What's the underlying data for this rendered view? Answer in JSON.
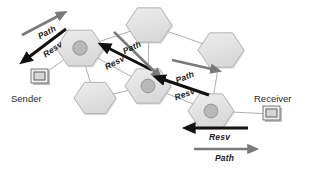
{
  "diagram": {
    "colors": {
      "path_arrow": "#7a7a7a",
      "resv_arrow": "#111111",
      "hex_fill": "#e2e2e2",
      "hex_stroke": "#a9a9a9",
      "router_circle": "#b8b8b8",
      "link_stroke": "#9a9a9a",
      "background": "#ffffff",
      "text": "#1c1c1c"
    },
    "endpoints": [
      {
        "id": "sender",
        "label": "Sender",
        "icon": "computer-icon",
        "x": 40,
        "y": 77,
        "label_x": 11,
        "label_y": 93
      },
      {
        "id": "receiver",
        "label": "Receiver",
        "icon": "computer-icon",
        "x": 272,
        "y": 114,
        "label_x": 254,
        "label_y": 93
      }
    ],
    "nodes": [
      {
        "id": "r1",
        "type": "router",
        "x": 80,
        "y": 48,
        "r": 24
      },
      {
        "id": "n2",
        "type": "plain",
        "x": 149,
        "y": 25,
        "r": 23
      },
      {
        "id": "n3",
        "type": "plain",
        "x": 221,
        "y": 50,
        "r": 23
      },
      {
        "id": "r4",
        "type": "router",
        "x": 148,
        "y": 86,
        "r": 23
      },
      {
        "id": "n5",
        "type": "plain",
        "x": 95,
        "y": 98,
        "r": 21
      },
      {
        "id": "r6",
        "type": "router",
        "x": 211,
        "y": 111,
        "r": 23
      }
    ],
    "links": [
      {
        "from": "r1",
        "to": "n2"
      },
      {
        "from": "n2",
        "to": "n3"
      },
      {
        "from": "n2",
        "to": "r4"
      },
      {
        "from": "n3",
        "to": "r6"
      },
      {
        "from": "r1",
        "to": "r4"
      },
      {
        "from": "r1",
        "to": "n5"
      },
      {
        "from": "n5",
        "to": "r4"
      },
      {
        "from": "r4",
        "to": "r6"
      },
      {
        "from": "r1",
        "to": "sender"
      },
      {
        "from": "r6",
        "to": "receiver"
      }
    ],
    "arrows": [
      {
        "id": "arrow-path-top-left",
        "label": "Path",
        "kind": "path",
        "x1": 22,
        "y1": 35,
        "x2": 62,
        "y2": 14,
        "label_x": 36,
        "label_y": 32,
        "label_rot": -27
      },
      {
        "id": "arrow-resv-top-left",
        "label": "Resv",
        "kind": "resv",
        "x1": 66,
        "y1": 29,
        "x2": 25,
        "y2": 60,
        "label_x": 41,
        "label_y": 51,
        "label_rot": -34
      },
      {
        "id": "arrow-path-middle",
        "label": "Path",
        "kind": "resv",
        "x1": 152,
        "y1": 70,
        "x2": 104,
        "y2": 46,
        "label_x": 121,
        "label_y": 47,
        "label_rot": -26
      },
      {
        "id": "arrow-resv-middle",
        "label": "Resv",
        "kind": "path",
        "x1": 114,
        "y1": 32,
        "x2": 158,
        "y2": 75,
        "label_x": 103,
        "label_y": 63,
        "label_rot": -28
      },
      {
        "id": "arrow-path-right",
        "label": "Path",
        "kind": "path",
        "x1": 172,
        "y1": 60,
        "x2": 216,
        "y2": 70,
        "label_x": 174,
        "label_y": 76,
        "label_rot": -22
      },
      {
        "id": "arrow-resv-right",
        "label": "Resv",
        "kind": "resv",
        "x1": 209,
        "y1": 95,
        "x2": 159,
        "y2": 78,
        "label_x": 173,
        "label_y": 93,
        "label_rot": -20
      },
      {
        "id": "arrow-resv-bottom",
        "label": "Resv",
        "kind": "resv",
        "x1": 248,
        "y1": 128,
        "x2": 189,
        "y2": 128,
        "label_x": 209,
        "label_y": 132,
        "label_rot": 0
      },
      {
        "id": "arrow-path-bottom",
        "label": "Path",
        "kind": "path",
        "x1": 194,
        "y1": 149,
        "x2": 253,
        "y2": 149,
        "label_x": 215,
        "label_y": 153,
        "label_rot": 0
      }
    ]
  }
}
